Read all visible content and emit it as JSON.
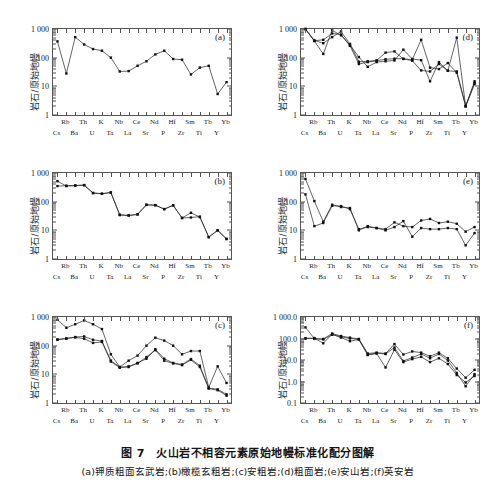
{
  "figure": {
    "caption_main": "图 7　火山岩不相容元素原始地幔标准化配分图解",
    "caption_sub": "(a)钾质粗面玄武岩;(b)橄榄玄粗岩;(c)安粗岩;(d)粗面岩;(e)安山岩;(f)英安岩",
    "y_axis_label": "岩石/原始地幔",
    "ghost_line": "........................................"
  },
  "elements_top": [
    "Rb",
    "Th",
    "K",
    "Nb",
    "Ce",
    "Nd",
    "Hf",
    "Sm",
    "Tb",
    "Yb"
  ],
  "elements_bottom": [
    "Cs",
    "Ba",
    "U",
    "Ta",
    "La",
    "Sr",
    "P",
    "Zr",
    "Ti",
    "Y"
  ],
  "chart_data": [
    {
      "id": "a",
      "panel_label": "(a)",
      "type": "line",
      "title": "钾质粗面玄武岩",
      "xlabel": "",
      "ylabel": "岩石/原始地幔",
      "x": [
        "Cs",
        "Rb",
        "Ba",
        "Th",
        "U",
        "K",
        "Ta",
        "Nb",
        "La",
        "Ce",
        "Sr",
        "Nd",
        "P",
        "Hf",
        "Zr",
        "Sm",
        "Ti",
        "Tb",
        "Y",
        "Yb"
      ],
      "ytick_labels": [
        "1 000",
        "100",
        "10",
        "1"
      ],
      "ylim": [
        1,
        1000
      ],
      "log_scale": true,
      "grid": false,
      "legend": "none",
      "series": [
        {
          "name": "sample-1",
          "values": [
            370,
            28,
            520,
            290,
            200,
            175,
            100,
            33,
            34,
            52,
            75,
            130,
            175,
            90,
            85,
            26,
            45,
            52,
            5.4,
            14,
            5.2,
            6.0
          ]
        }
      ],
      "series_x_count": 20
    },
    {
      "id": "d",
      "panel_label": "(d)",
      "type": "line",
      "title": "粗面岩",
      "ylabel": "岩石/原始地幔",
      "x": [
        "Cs",
        "Rb",
        "Ba",
        "Th",
        "U",
        "K",
        "Ta",
        "Nb",
        "La",
        "Ce",
        "Sr",
        "Nd",
        "P",
        "Hf",
        "Zr",
        "Sm",
        "Ti",
        "Tb",
        "Y",
        "Yb"
      ],
      "ytick_labels": [
        "1 000",
        "100",
        "10",
        "1"
      ],
      "ylim": [
        1,
        1000
      ],
      "log_scale": true,
      "grid": false,
      "series": [
        {
          "name": "sample-1",
          "values": [
            1000,
            380,
            135,
            900,
            600,
            280,
            105,
            48,
            70,
            75,
            80,
            190,
            90,
            82,
            15,
            70,
            35,
            500,
            2.0,
            15,
            5.5,
            7.5
          ]
        },
        {
          "name": "sample-2",
          "values": [
            1000,
            400,
            320,
            520,
            820,
            300,
            72,
            75,
            80,
            150,
            165,
            90,
            85,
            420,
            45,
            40,
            65,
            30,
            2.0,
            12,
            6.5,
            7.0
          ]
        },
        {
          "name": "sample-3",
          "values": [
            990,
            390,
            420,
            700,
            640,
            260,
            60,
            70,
            78,
            88,
            92,
            92,
            78,
            36,
            33,
            60,
            35,
            33,
            2.1,
            13,
            7.0,
            8.0
          ]
        }
      ]
    },
    {
      "id": "b",
      "panel_label": "(b)",
      "type": "line",
      "title": "橄榄玄粗岩",
      "ylabel": "岩石/原始地幔",
      "x": [
        "Cs",
        "Rb",
        "Ba",
        "Th",
        "U",
        "K",
        "Ta",
        "Nb",
        "La",
        "Ce",
        "Sr",
        "Nd",
        "P",
        "Hf",
        "Zr",
        "Sm",
        "Ti",
        "Tb",
        "Y",
        "Yb"
      ],
      "ytick_labels": [
        "1 000",
        "100",
        "10",
        "1"
      ],
      "ylim": [
        1,
        1000
      ],
      "log_scale": true,
      "grid": false,
      "series": [
        {
          "name": "sample-1",
          "values": [
            520,
            350,
            360,
            380,
            200,
            190,
            210,
            35,
            33,
            36,
            78,
            76,
            55,
            75,
            27,
            28,
            30,
            5.8,
            10,
            5.0,
            6.5
          ]
        },
        {
          "name": "sample-2",
          "values": [
            350,
            360,
            370,
            375,
            200,
            188,
            208,
            34,
            33,
            36,
            77,
            75,
            55,
            74,
            27,
            41,
            29,
            5.8,
            10,
            5.0,
            6.4
          ]
        }
      ]
    },
    {
      "id": "e",
      "panel_label": "(e)",
      "type": "line",
      "title": "安山岩",
      "ylabel": "岩石/原始地幔",
      "x": [
        "Cs",
        "Rb",
        "Ba",
        "Th",
        "U",
        "K",
        "Ta",
        "Nb",
        "La",
        "Ce",
        "Sr",
        "Nd",
        "P",
        "Hf",
        "Zr",
        "Sm",
        "Ti",
        "Tb",
        "Y",
        "Yb"
      ],
      "ytick_labels": [
        "1 000",
        "100",
        "10",
        "1"
      ],
      "ylim": [
        1,
        1000
      ],
      "log_scale": true,
      "grid": false,
      "series": [
        {
          "name": "sample-1",
          "values": [
            620,
            105,
            20,
            78,
            65,
            60,
            10,
            14,
            12,
            10,
            13,
            21,
            6,
            12,
            11,
            11,
            12,
            11,
            3.0,
            8.0,
            4.2,
            5.5
          ]
        },
        {
          "name": "sample-2",
          "values": [
            180,
            14,
            18,
            72,
            70,
            55,
            11,
            13,
            12,
            11,
            19,
            14,
            13,
            22,
            25,
            18,
            20,
            17,
            9.0,
            13,
            8.5,
            11.5
          ]
        }
      ]
    },
    {
      "id": "c",
      "panel_label": "(c)",
      "type": "line",
      "title": "安粗岩",
      "ylabel": "岩石/原始地幔",
      "x": [
        "Cs",
        "Rb",
        "Ba",
        "Th",
        "U",
        "K",
        "Ta",
        "Nb",
        "La",
        "Ce",
        "Sr",
        "Nd",
        "P",
        "Hf",
        "Zr",
        "Sm",
        "Ti",
        "Tb",
        "Y",
        "Yb"
      ],
      "ytick_labels": [
        "1 000",
        "100",
        "10",
        "1"
      ],
      "ylim": [
        1,
        1000
      ],
      "log_scale": true,
      "grid": false,
      "series": [
        {
          "name": "sample-1",
          "values": [
            800,
            420,
            560,
            760,
            560,
            380,
            50,
            18,
            30,
            45,
            100,
            190,
            150,
            100,
            50,
            65,
            65,
            3.5,
            19,
            5.0,
            7.5
          ]
        },
        {
          "name": "sample-2",
          "values": [
            160,
            180,
            200,
            210,
            160,
            145,
            30,
            18,
            18,
            25,
            35,
            75,
            35,
            25,
            22,
            34,
            20,
            3.3,
            3.0,
            2.0,
            2.8
          ]
        },
        {
          "name": "sample-3",
          "values": [
            165,
            175,
            195,
            175,
            125,
            135,
            28,
            17,
            19,
            24,
            40,
            70,
            30,
            24,
            21,
            32,
            18,
            3.2,
            2.8,
            1.8,
            2.5
          ]
        }
      ]
    },
    {
      "id": "f",
      "panel_label": "(f)",
      "type": "line",
      "title": "英安岩",
      "ylabel": "岩石/原始地幔",
      "x": [
        "Cs",
        "Rb",
        "Ba",
        "Th",
        "U",
        "K",
        "Ta",
        "Nb",
        "La",
        "Ce",
        "Sr",
        "Nd",
        "P",
        "Hf",
        "Zr",
        "Sm",
        "Ti",
        "Tb",
        "Y",
        "Yb"
      ],
      "ytick_labels": [
        "1 000.0",
        "100.0",
        "10.0",
        "1.0",
        "0.1"
      ],
      "ylim": [
        0.1,
        1000
      ],
      "log_scale": true,
      "grid": false,
      "series": [
        {
          "name": "sample-1",
          "values": [
            330,
            100,
            95,
            170,
            130,
            110,
            95,
            20,
            22,
            20,
            55,
            18,
            25,
            22,
            15,
            22,
            12,
            4.0,
            1.5,
            3.5,
            4.2
          ]
        },
        {
          "name": "sample-2",
          "values": [
            100,
            105,
            60,
            160,
            110,
            75,
            90,
            18,
            21,
            19,
            38,
            9,
            13,
            19,
            12,
            19,
            9.5,
            2.5,
            0.6,
            2.2,
            2.5
          ]
        },
        {
          "name": "sample-3",
          "values": [
            102,
            98,
            90,
            150,
            120,
            100,
            92,
            17,
            20,
            4.5,
            30,
            8,
            11,
            14,
            8,
            12,
            6.5,
            2.0,
            0.9,
            1.8,
            1.3
          ]
        }
      ]
    }
  ]
}
